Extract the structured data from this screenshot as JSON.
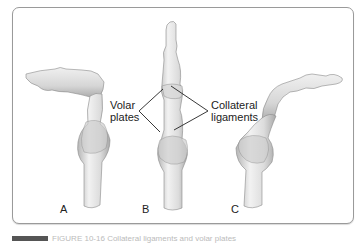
{
  "figure": {
    "panels": [
      {
        "letter": "A",
        "description": "finger in flexed (bent) position"
      },
      {
        "letter": "B",
        "description": "finger in extended position"
      },
      {
        "letter": "C",
        "description": "finger in hyperextended position"
      }
    ],
    "labels": {
      "volar_line1": "Volar",
      "volar_line2": "plates",
      "collateral_line1": "Collateral",
      "collateral_line2": "ligaments"
    },
    "colors": {
      "bone_fill": "#e6e6e6",
      "bone_shade": "#b8b8b8",
      "outline": "#8a8a8a",
      "frame": "#9a9a9a",
      "leader_line": "#222222"
    }
  },
  "caption": {
    "text": "FIGURE 10-16 Collateral ligaments and volar plates"
  }
}
